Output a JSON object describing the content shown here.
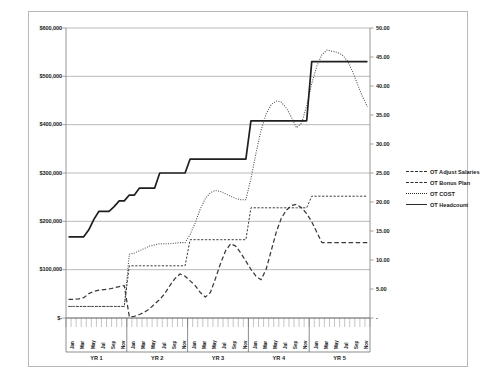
{
  "chart_data": {
    "type": "line",
    "title": "",
    "subtitle": "",
    "xlabel": "",
    "ylabel": "",
    "grid": true,
    "legend_position": "right",
    "axes": {
      "left": {
        "label": "",
        "ticks": [
          "$-",
          "$100,000",
          "$200,000",
          "$300,000",
          "$400,000",
          "$500,000",
          "$600,000"
        ],
        "min": 0,
        "max": 600000,
        "step": 100000
      },
      "right": {
        "label": "",
        "ticks": [
          "-",
          "5.00",
          "10.00",
          "15.00",
          "20.00",
          "25.00",
          "30.00",
          "35.00",
          "40.00",
          "45.00",
          "50.00"
        ],
        "min": 0,
        "max": 50,
        "step": 5
      },
      "x": {
        "group_label_prefix": "YR",
        "groups": [
          "YR 1",
          "YR 2",
          "YR 3",
          "YR 4",
          "YR 5"
        ],
        "months": [
          "Jan",
          "Feb",
          "Mar",
          "Apr",
          "May",
          "Jun",
          "Jul",
          "Aug",
          "Sep",
          "Oct",
          "Nov",
          "Dec"
        ],
        "labeled_months": [
          "Jan",
          "Mar",
          "May",
          "Jul",
          "Sep",
          "Nov"
        ],
        "total_points": 60
      }
    },
    "series": [
      {
        "name": "OT Adjust Salaries",
        "style": "fine-dashed",
        "color": "#3a3a3a",
        "axis": "right",
        "values": [
          2.0,
          2.0,
          2.0,
          2.0,
          2.0,
          2.0,
          2.0,
          2.0,
          2.0,
          2.0,
          2.0,
          2.0,
          9.0,
          9.0,
          9.0,
          9.0,
          9.0,
          9.0,
          9.0,
          9.0,
          9.0,
          9.0,
          9.0,
          9.0,
          13.5,
          13.5,
          13.5,
          13.5,
          13.5,
          13.5,
          13.5,
          13.5,
          13.5,
          13.5,
          13.5,
          13.5,
          19.0,
          19.0,
          19.0,
          19.0,
          19.0,
          19.0,
          19.0,
          19.0,
          19.0,
          19.0,
          19.0,
          19.0,
          21.0,
          21.0,
          21.0,
          21.0,
          21.0,
          21.0,
          21.0,
          21.0,
          21.0,
          21.0,
          21.0,
          21.0
        ]
      },
      {
        "name": "OT Bonus Plan",
        "style": "dashed",
        "color": "#3a3a3a",
        "axis": "right",
        "values": [
          3.2,
          3.2,
          3.3,
          3.5,
          4.2,
          4.6,
          4.8,
          4.9,
          5.0,
          5.2,
          5.4,
          5.6,
          0.2,
          0.3,
          0.6,
          1.0,
          1.6,
          2.4,
          3.2,
          4.2,
          5.6,
          6.8,
          7.6,
          7.2,
          6.4,
          5.6,
          4.4,
          3.6,
          4.4,
          6.8,
          9.4,
          11.6,
          12.8,
          12.4,
          11.2,
          9.8,
          8.4,
          7.2,
          6.6,
          8.4,
          11.6,
          14.8,
          17.2,
          18.6,
          19.4,
          19.6,
          19.0,
          18.0,
          16.6,
          14.8,
          13.0,
          13.0,
          13.0,
          13.0,
          13.0,
          13.0,
          13.0,
          13.0,
          13.0,
          13.0
        ]
      },
      {
        "name": "OT COST",
        "style": "dotted",
        "color": "#4a4a4a",
        "axis": "right",
        "values": [
          2.0,
          2.0,
          2.0,
          2.0,
          2.0,
          2.0,
          2.0,
          2.0,
          2.0,
          2.0,
          2.0,
          2.0,
          11.0,
          11.2,
          11.6,
          12.0,
          12.4,
          12.6,
          12.8,
          12.8,
          12.8,
          12.9,
          13.0,
          13.0,
          14.4,
          16.4,
          18.8,
          20.6,
          21.6,
          22.0,
          21.8,
          21.4,
          21.0,
          20.6,
          20.4,
          20.4,
          24.0,
          28.4,
          32.4,
          35.2,
          36.8,
          37.4,
          37.2,
          36.2,
          34.6,
          32.8,
          33.6,
          36.6,
          40.4,
          43.4,
          45.4,
          46.2,
          46.0,
          45.8,
          45.4,
          44.4,
          42.6,
          40.4,
          38.2,
          36.4
        ]
      },
      {
        "name": "OT Headcount",
        "style": "solid",
        "color": "#1f1f1f",
        "axis": "right",
        "values": [
          14.0,
          14.0,
          14.0,
          14.0,
          15.2,
          17.0,
          18.4,
          18.4,
          18.4,
          19.2,
          20.2,
          20.2,
          21.2,
          21.2,
          22.4,
          22.4,
          22.4,
          22.4,
          25.0,
          25.0,
          25.0,
          25.0,
          25.0,
          25.0,
          27.4,
          27.4,
          27.4,
          27.4,
          27.4,
          27.4,
          27.4,
          27.4,
          27.4,
          27.4,
          27.4,
          27.4,
          34.0,
          34.0,
          34.0,
          34.0,
          34.0,
          34.0,
          34.0,
          34.0,
          34.0,
          34.0,
          34.0,
          34.0,
          44.2,
          44.2,
          44.2,
          44.2,
          44.2,
          44.2,
          44.2,
          44.2,
          44.2,
          44.2,
          44.2,
          44.2
        ]
      }
    ]
  },
  "legend": {
    "items": [
      {
        "label": "OT Adjust Salaries",
        "style": "finedash"
      },
      {
        "label": "OT Bonus Plan",
        "style": "dash"
      },
      {
        "label": "OT COST",
        "style": "dot"
      },
      {
        "label": "OT Headcount",
        "style": "solid"
      }
    ]
  }
}
